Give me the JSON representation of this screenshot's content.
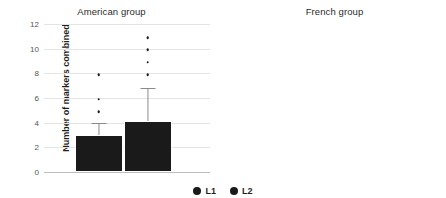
{
  "ylabel": "Number of markers combined",
  "legend": [
    {
      "label": "L1",
      "color": "#1a1a1a"
    },
    {
      "label": "L2",
      "color": "#1a1a1a"
    }
  ],
  "chart_data": [
    {
      "type": "bar",
      "title": "American group",
      "xlabel": "",
      "ylabel": "Number of markers combined",
      "ylim": [
        0,
        12
      ],
      "yticks": [
        0,
        2,
        4,
        6,
        8,
        10,
        12
      ],
      "grid": true,
      "legend_position": "bottom-center",
      "categories": [
        "L1",
        "L2"
      ],
      "values": [
        3.0,
        4.1
      ],
      "error_upper": [
        4.0,
        6.8
      ],
      "scatter_points": {
        "L1": [
          5,
          6,
          8
        ],
        "L2": [
          8,
          9,
          10,
          11
        ]
      }
    },
    {
      "type": "bar",
      "title": "French group",
      "xlabel": "",
      "ylabel": "Number of markers combined",
      "ylim": [
        0,
        16
      ],
      "yticks": [
        0,
        2,
        4,
        6,
        8,
        10,
        12,
        14,
        16
      ],
      "grid": true,
      "legend_position": "bottom-center",
      "categories": [
        "L1",
        "L2"
      ],
      "values": [
        2.75,
        2.8
      ],
      "error_upper": [
        3.7,
        3.75
      ],
      "scatter_points": {
        "L1": [
          5,
          6,
          7
        ],
        "L2": [
          5,
          6,
          7,
          8,
          10,
          14
        ]
      }
    }
  ]
}
